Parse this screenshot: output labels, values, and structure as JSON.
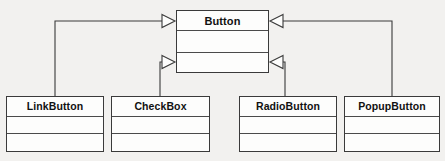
{
  "diagram": {
    "kind": "uml-class-diagram",
    "relationship": "generalization",
    "background_color": "#f2f1ef",
    "line_color": "#3a3a3a",
    "box_fill_color": "#fdfdfc",
    "text_color": "#111111"
  },
  "superclass": {
    "name": "Button",
    "compartments": {
      "attributes": "",
      "operations": ""
    }
  },
  "subclasses": [
    {
      "name": "LinkButton",
      "compartments": {
        "attributes": "",
        "operations": ""
      }
    },
    {
      "name": "CheckBox",
      "compartments": {
        "attributes": "",
        "operations": ""
      }
    },
    {
      "name": "RadioButton",
      "compartments": {
        "attributes": "",
        "operations": ""
      }
    },
    {
      "name": "PopupButton",
      "compartments": {
        "attributes": "",
        "operations": ""
      }
    }
  ],
  "connectors": [
    {
      "from": "LinkButton",
      "to": "Button",
      "arrow": "hollow-triangle",
      "attach_side": "left"
    },
    {
      "from": "CheckBox",
      "to": "Button",
      "arrow": "hollow-triangle",
      "attach_side": "left"
    },
    {
      "from": "RadioButton",
      "to": "Button",
      "arrow": "hollow-triangle",
      "attach_side": "right"
    },
    {
      "from": "PopupButton",
      "to": "Button",
      "arrow": "hollow-triangle",
      "attach_side": "right"
    }
  ]
}
